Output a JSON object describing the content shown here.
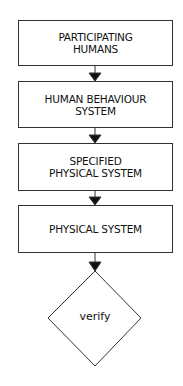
{
  "diagram": {
    "nodes": [
      {
        "id": "n1",
        "shape": "rectangle",
        "lines": [
          "PARTICIPATING",
          "HUMANS"
        ]
      },
      {
        "id": "n2",
        "shape": "rectangle",
        "lines": [
          "HUMAN BEHAVIOUR",
          "SYSTEM"
        ]
      },
      {
        "id": "n3",
        "shape": "rectangle",
        "lines": [
          "SPECIFIED",
          "PHYSICAL SYSTEM"
        ]
      },
      {
        "id": "n4",
        "shape": "rectangle",
        "lines": [
          "PHYSICAL SYSTEM"
        ]
      },
      {
        "id": "n5",
        "shape": "diamond",
        "label": "verify"
      }
    ],
    "edges": [
      {
        "from": "n1",
        "to": "n2"
      },
      {
        "from": "n2",
        "to": "n3"
      },
      {
        "from": "n3",
        "to": "n4"
      },
      {
        "from": "n4",
        "to": "n5"
      }
    ],
    "colors": {
      "stroke": "#333333",
      "background": "#ffffff",
      "text": "#111111"
    }
  }
}
